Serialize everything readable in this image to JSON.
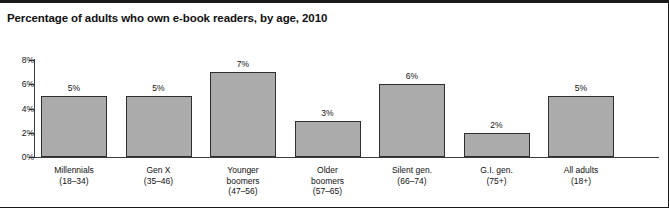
{
  "chart_data": {
    "type": "bar",
    "title": "Percentage of adults who own e-book readers, by age, 2010",
    "xlabel": "",
    "ylabel": "",
    "ylim": [
      0,
      8
    ],
    "yticks": [
      "0%",
      "2%",
      "4%",
      "6%",
      "8%"
    ],
    "ytick_values": [
      0,
      2,
      4,
      6,
      8
    ],
    "grid": false,
    "legend": "none",
    "bar_color": "#ababab",
    "bar_border_color": "#2e2e2e",
    "categories": [
      "Millennials\n(18–34)",
      "Gen X\n(35–46)",
      "Younger\nboomers\n(47–56)",
      "Older\nboomers\n(57–65)",
      "Silent gen.\n(66–74)",
      "G.I. gen.\n(75+)",
      "All adults\n(18+)"
    ],
    "values": [
      5,
      5,
      7,
      3,
      6,
      2,
      5
    ],
    "value_labels": [
      "5%",
      "5%",
      "7%",
      "3%",
      "6%",
      "2%",
      "5%"
    ]
  }
}
